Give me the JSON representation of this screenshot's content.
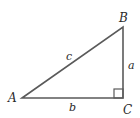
{
  "diagram": {
    "type": "right-triangle",
    "vertices": [
      {
        "label": "A",
        "x": 22,
        "y": 98
      },
      {
        "label": "B",
        "x": 123,
        "y": 27
      },
      {
        "label": "C",
        "x": 123,
        "y": 98
      }
    ],
    "sides": [
      {
        "label": "c",
        "from": "A",
        "to": "B"
      },
      {
        "label": "a",
        "from": "B",
        "to": "C"
      },
      {
        "label": "b",
        "from": "A",
        "to": "C"
      }
    ],
    "right_angle_at": "C",
    "stroke_color": "#555555"
  },
  "labels": {
    "A": "A",
    "B": "B",
    "C": "C",
    "a": "a",
    "b": "b",
    "c": "c"
  }
}
